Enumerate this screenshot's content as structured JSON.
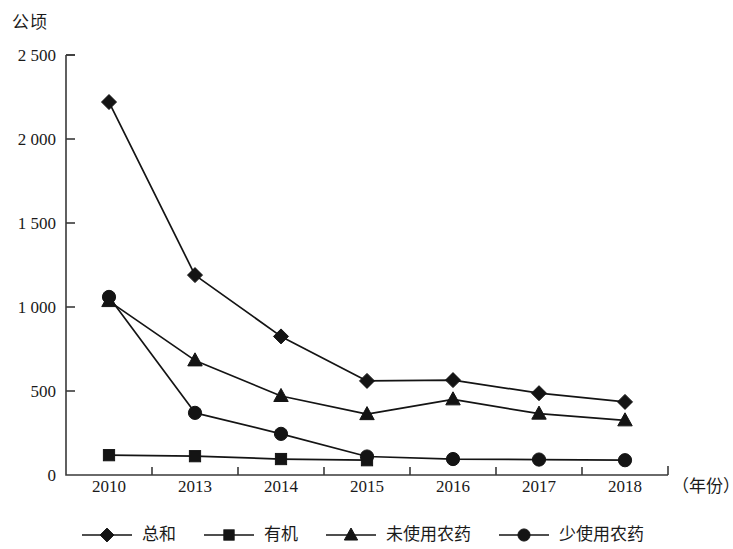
{
  "chart_data": {
    "type": "line",
    "title": "",
    "ylabel": "公顷",
    "xlabel": "（年份）",
    "categories": [
      "2010",
      "2013",
      "2014",
      "2015",
      "2016",
      "2017",
      "2018"
    ],
    "ytick_labels": [
      "0",
      "500",
      "1 000",
      "1 500",
      "2 000",
      "2 500"
    ],
    "ytick_values": [
      0,
      500,
      1000,
      1500,
      2000,
      2500
    ],
    "ylim": [
      0,
      2500
    ],
    "grid": false,
    "legend_position": "bottom",
    "line_color": "#141414",
    "series": [
      {
        "name": "总和",
        "marker": "diamond",
        "values": [
          2220,
          1190,
          825,
          560,
          565,
          487,
          435
        ]
      },
      {
        "name": "有机",
        "marker": "square",
        "values": [
          118,
          112,
          95,
          88,
          null,
          null,
          null
        ]
      },
      {
        "name": "未使用农药",
        "marker": "triangle",
        "values": [
          1035,
          682,
          470,
          362,
          450,
          365,
          325
        ]
      },
      {
        "name": "少使用农药",
        "marker": "circle",
        "values": [
          1060,
          370,
          245,
          110,
          95,
          92,
          88
        ]
      }
    ]
  },
  "legend": {
    "items": [
      {
        "label": "总和",
        "marker": "diamond-marker-icon"
      },
      {
        "label": "有机",
        "marker": "square-marker-icon"
      },
      {
        "label": "未使用农药",
        "marker": "triangle-marker-icon"
      },
      {
        "label": "少使用农药",
        "marker": "circle-marker-icon"
      }
    ]
  }
}
